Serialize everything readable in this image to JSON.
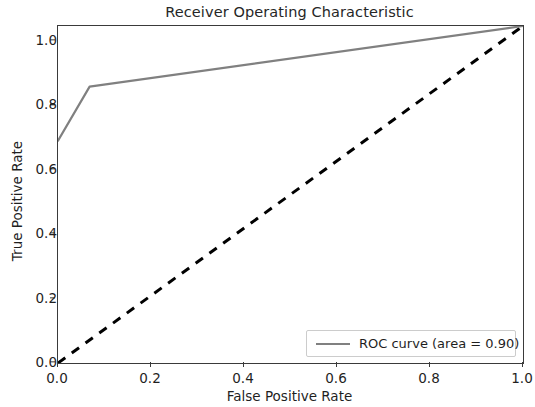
{
  "chart_data": {
    "type": "line",
    "title": "Receiver Operating Characteristic",
    "xlabel": "False Positive Rate",
    "ylabel": "True Positive Rate",
    "xlim": [
      0.0,
      1.0
    ],
    "ylim": [
      0.0,
      1.0
    ],
    "xticks": [
      "0.0",
      "0.2",
      "0.4",
      "0.6",
      "0.8",
      "1.0"
    ],
    "xtick_values": [
      0.0,
      0.2,
      0.4,
      0.6,
      0.8,
      1.0
    ],
    "yticks": [
      "0.0",
      "0.2",
      "0.4",
      "0.6",
      "0.8",
      "1.0"
    ],
    "ytick_values": [
      0.0,
      0.2,
      0.4,
      0.6,
      0.8,
      1.0
    ],
    "grid": false,
    "legend_position": "lower right",
    "series": [
      {
        "name": "ROC curve (area = 0.90)",
        "color": "#808080",
        "linestyle": "solid",
        "linewidth": 2,
        "x": [
          0.0,
          0.068,
          1.0
        ],
        "y": [
          0.66,
          0.82,
          1.0
        ]
      },
      {
        "name": "chance-diagonal",
        "color": "#000000",
        "linestyle": "dashed",
        "linewidth": 2.5,
        "show_in_legend": false,
        "x": [
          0.0,
          1.0
        ],
        "y": [
          0.0,
          1.0
        ]
      }
    ],
    "annotations": {
      "auc": "0.90"
    }
  },
  "legend": {
    "entries": [
      {
        "label": "ROC curve (area = 0.90)",
        "color": "#808080"
      }
    ]
  },
  "axis_color": "#3a3a3a",
  "background": "#ffffff"
}
